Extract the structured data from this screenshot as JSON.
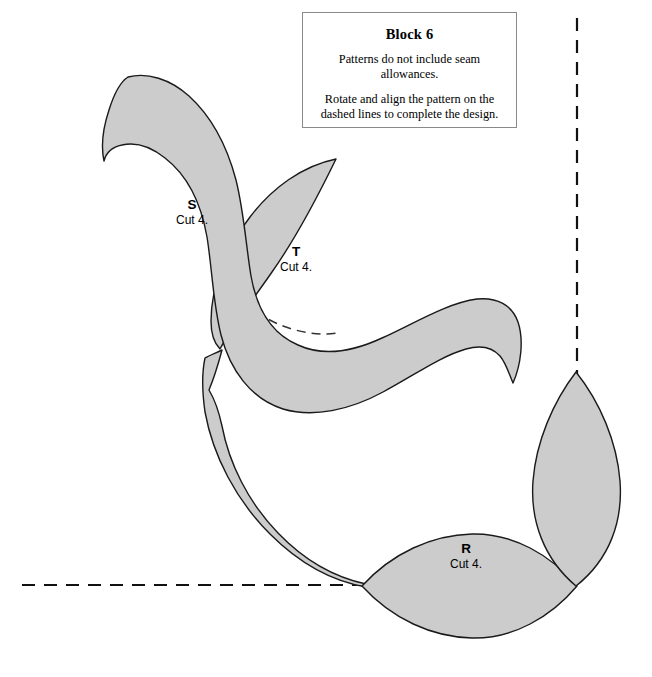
{
  "note": {
    "title": "Block 6",
    "paragraphs": [
      "Patterns do not include seam allowances.",
      "Rotate and align the pattern on the dashed lines to complete the design."
    ],
    "paragraph_1": "Patterns do not include seam allowances.",
    "paragraph_2": "Rotate and align the pattern on the dashed lines to complete the design."
  },
  "pieces": [
    {
      "id": "S",
      "letter": "S",
      "cut": "Cut 4.",
      "label_x": 192,
      "label_y": 205,
      "description": "long curved vine stem with hooked tips"
    },
    {
      "id": "T",
      "letter": "T",
      "cut": "Cut 4.",
      "label_x": 296,
      "label_y": 252,
      "description": "pointed leaf upper"
    },
    {
      "id": "R",
      "letter": "R",
      "cut": "Cut 4.",
      "label_x": 466,
      "label_y": 549,
      "description": "lens shaped leaf on horizontal guide"
    }
  ],
  "colors": {
    "piece_fill": "#cccccc",
    "piece_outline": "#1a1a1a",
    "guide_line": "#111111",
    "hidden_seam": "#333333",
    "background": "#ffffff",
    "note_border": "#8a8a8a"
  },
  "guides": {
    "vertical": {
      "x": 577,
      "y1": 18,
      "y2": 585
    },
    "horizontal": {
      "y": 585,
      "x1": 22,
      "x2": 577
    }
  }
}
